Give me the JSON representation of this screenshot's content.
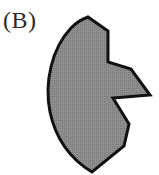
{
  "figure": {
    "panel_label": "(B)",
    "background_color": "#ffffff",
    "canvas": {
      "width": 159,
      "height": 175
    }
  },
  "shape": {
    "name": "notched-crescent-polygon",
    "fill_color": "#878787",
    "stroke_color": "#111111",
    "stroke_width": 3,
    "texture": "fine-dither",
    "description": "Gray filled leaf-like region with smooth curved left edge, pointed top apex, pointed bottom apex, and two wedge notches cut into the right side",
    "path": "M 88 17 L 108 31 L 108 62 L 131 69 L 150 95 L 113 98 L 129 124 L 124 146 L 92 172 C 72 160 56 140 50 112 C 44 82 52 48 71 28 C 76 23 82 19 88 17 Z",
    "vertices": [
      {
        "name": "top-apex",
        "x": 88,
        "y": 17
      },
      {
        "name": "upper-right-shoulder",
        "x": 108,
        "y": 31
      },
      {
        "name": "upper-notch-inner-corner",
        "x": 108,
        "y": 62
      },
      {
        "name": "mid-wedge-upper",
        "x": 131,
        "y": 69
      },
      {
        "name": "mid-wedge-tip",
        "x": 150,
        "y": 95
      },
      {
        "name": "mid-notch-inner-corner",
        "x": 113,
        "y": 98
      },
      {
        "name": "lower-wedge-tip",
        "x": 129,
        "y": 124
      },
      {
        "name": "lower-right-corner",
        "x": 124,
        "y": 146
      },
      {
        "name": "bottom-apex",
        "x": 92,
        "y": 172
      }
    ],
    "curved_edge": {
      "name": "left-arc",
      "from": {
        "x": 92,
        "y": 172
      },
      "to": {
        "x": 88,
        "y": 17
      },
      "leftmost_x": 48
    }
  }
}
